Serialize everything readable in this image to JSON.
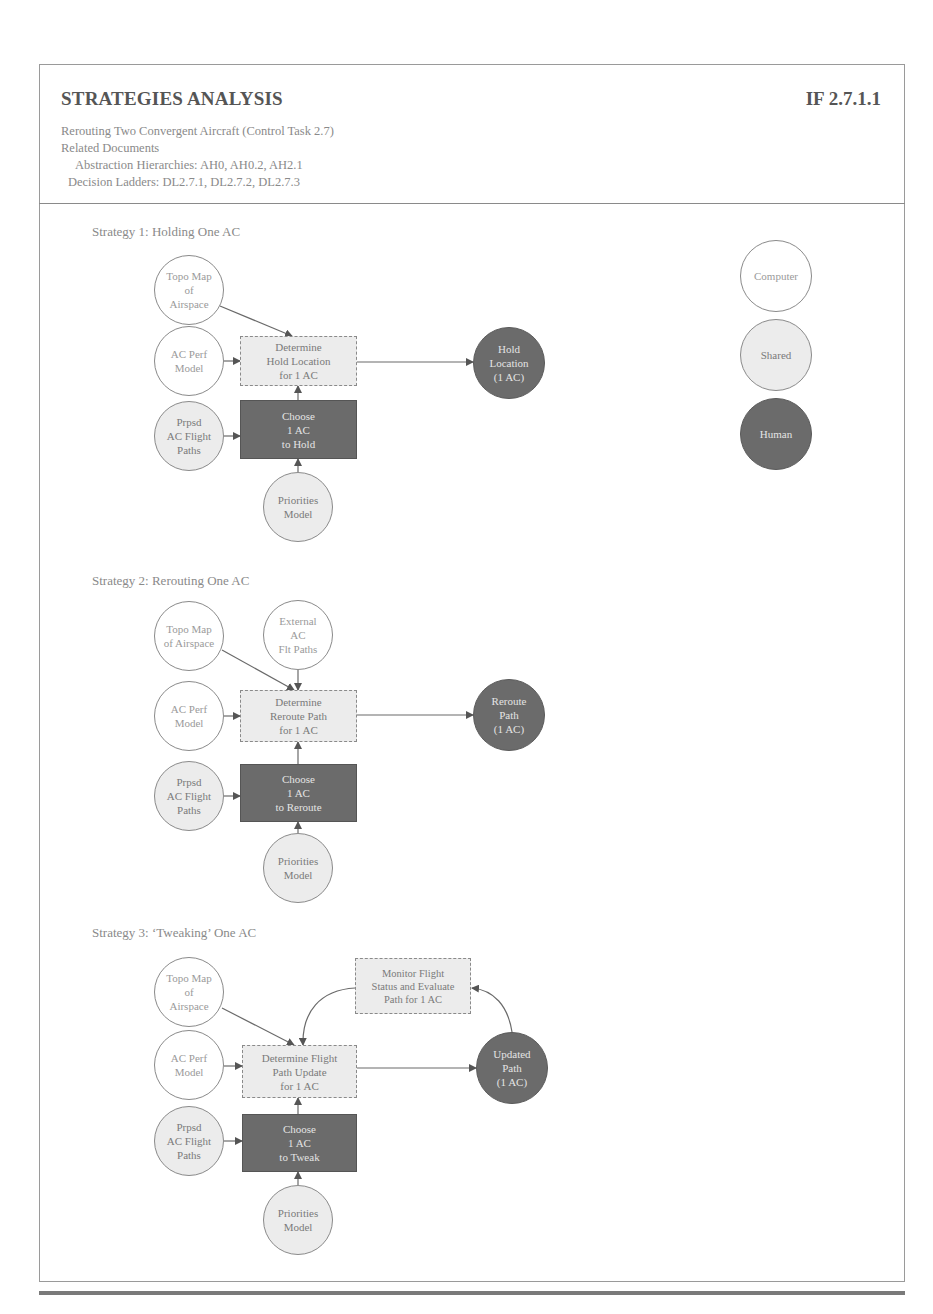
{
  "header": {
    "title": "STRATEGIES ANALYSIS",
    "doc_id": "IF 2.7.1.1",
    "task": "Rerouting Two Convergent Aircraft (Control Task 2.7)",
    "related_label": "Related Documents",
    "abstraction": "Abstraction Hierarchies:  AH0, AH0.2, AH2.1",
    "decision": "Decision Ladders:  DL2.7.1, DL2.7.2, DL2.7.3"
  },
  "legend": {
    "computer": "Computer",
    "shared": "Shared",
    "human": "Human",
    "colors": {
      "computer": "#ffffff",
      "shared": "#ececec",
      "human": "#6b6b6b"
    }
  },
  "strategies": [
    {
      "label": "Strategy 1: Holding One AC",
      "nodes": {
        "topo": "Topo Map\nof\nAirspace",
        "perf": "AC Perf\nModel",
        "prpsd": "Prpsd\nAC Flight\nPaths",
        "determine": "Determine\nHold Location\nfor 1 AC",
        "choose": "Choose\n1 AC\nto Hold",
        "priorities": "Priorities\nModel",
        "output": "Hold\nLocation\n(1 AC)"
      }
    },
    {
      "label": "Strategy 2: Rerouting One AC",
      "nodes": {
        "topo": "Topo Map\nof Airspace",
        "external": "External\nAC\nFlt Paths",
        "perf": "AC Perf\nModel",
        "prpsd": "Prpsd\nAC Flight\nPaths",
        "determine": "Determine\nReroute Path\nfor 1 AC",
        "choose": "Choose\n1 AC\nto Reroute",
        "priorities": "Priorities\nModel",
        "output": "Reroute\nPath\n(1 AC)"
      }
    },
    {
      "label": "Strategy 3: ‘Tweaking’ One AC",
      "nodes": {
        "topo": "Topo Map\nof\nAirspace",
        "perf": "AC Perf\nModel",
        "prpsd": "Prpsd\nAC Flight\nPaths",
        "determine": "Determine Flight\nPath Update\nfor 1 AC",
        "choose": "Choose\n1 AC\nto Tweak",
        "priorities": "Priorities\nModel",
        "monitor": "Monitor Flight\nStatus and Evaluate\nPath for 1 AC",
        "output": "Updated\nPath\n(1 AC)"
      }
    }
  ]
}
